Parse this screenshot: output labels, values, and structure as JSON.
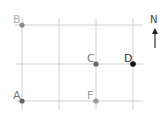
{
  "diagram": {
    "type": "street-grid",
    "vertical_lines_x": [
      22,
      59,
      96,
      133
    ],
    "horizontal_lines_y": [
      25,
      64,
      101
    ],
    "points": [
      {
        "label": "B",
        "x": 22,
        "y": 25,
        "color": "#8a8a8a"
      },
      {
        "label": "C",
        "x": 96,
        "y": 64,
        "color": "#666666"
      },
      {
        "label": "D",
        "x": 133,
        "y": 64,
        "color": "#111111"
      },
      {
        "label": "A",
        "x": 22,
        "y": 101,
        "color": "#666666"
      },
      {
        "label": "F",
        "x": 96,
        "y": 101,
        "color": "#9a9a9a"
      }
    ],
    "compass": {
      "label": "N",
      "direction": "north"
    }
  },
  "labels": {
    "B": "B",
    "C": "C",
    "D": "D",
    "A": "A",
    "F": "F",
    "N": "N"
  }
}
